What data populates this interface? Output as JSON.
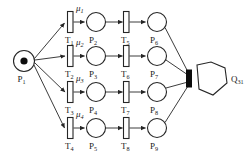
{
  "diagram": {
    "type": "petri-net",
    "source_place": {
      "id": "P1",
      "label": "P",
      "subscript": "1",
      "tokens": 1,
      "cx": 24,
      "cy": 61,
      "r": 10.5
    },
    "sink": {
      "id": "Q31",
      "label": "Q",
      "subscript": "31",
      "shape": "hexagon",
      "cx": 212,
      "cy": 79,
      "rx": 17,
      "ry": 16
    },
    "join_bar": {
      "x": 188,
      "y": 70,
      "w": 5.5,
      "h": 17
    },
    "rows": [
      {
        "y": 22,
        "transition1": {
          "label": "T",
          "subscript": "1",
          "rate": "μ",
          "rate_subscript": "1",
          "x": 70
        },
        "place": {
          "label": "P",
          "subscript": "2",
          "cx": 96
        },
        "transition2": {
          "label": "T",
          "subscript": "5",
          "x": 126
        },
        "place2": {
          "label": "P",
          "subscript": "6",
          "cx": 157
        }
      },
      {
        "y": 56,
        "transition1": {
          "label": "T",
          "subscript": "2",
          "rate": "μ",
          "rate_subscript": "2",
          "x": 70
        },
        "place": {
          "label": "P",
          "subscript": "3",
          "cx": 96
        },
        "transition2": {
          "label": "T",
          "subscript": "6",
          "x": 126
        },
        "place2": {
          "label": "P",
          "subscript": "7",
          "cx": 157
        }
      },
      {
        "y": 92,
        "transition1": {
          "label": "T",
          "subscript": "3",
          "rate": "μ",
          "rate_subscript": "3",
          "x": 70
        },
        "place": {
          "label": "P",
          "subscript": "4",
          "cx": 96
        },
        "transition2": {
          "label": "T",
          "subscript": "7",
          "x": 126
        },
        "place2": {
          "label": "P",
          "subscript": "8",
          "cx": 157
        }
      },
      {
        "y": 128,
        "transition1": {
          "label": "T",
          "subscript": "4",
          "rate": "μ",
          "rate_subscript": "4",
          "x": 70
        },
        "place": {
          "label": "P",
          "subscript": "5",
          "cx": 96
        },
        "transition2": {
          "label": "T",
          "subscript": "8",
          "x": 126
        },
        "place2": {
          "label": "P",
          "subscript": "9",
          "cx": 157
        }
      }
    ],
    "colors": {
      "stroke": "#262626",
      "fill": "#ffffff",
      "token": "#0d0d0d",
      "background": "#ffffff"
    }
  }
}
